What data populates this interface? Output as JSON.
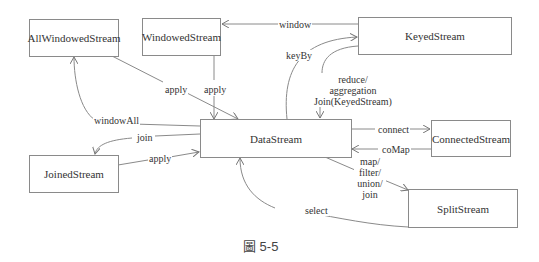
{
  "nodes": {
    "all_windowed_stream": "AllWindowedStream",
    "windowed_stream": "WindowedStream",
    "keyed_stream": "KeyedStream",
    "data_stream": "DataStream",
    "connected_stream": "ConnectedStream",
    "joined_stream": "JoinedStream",
    "split_stream": "SplitStream"
  },
  "edges": {
    "window": "window",
    "key_by": "keyBy",
    "reduce": "reduce/",
    "aggregation": "aggregation",
    "join_keyed": "Join(KeyedStream)",
    "apply_all_windowed": "apply",
    "apply_windowed": "apply",
    "window_all": "windowAll",
    "join": "join",
    "apply_joined": "apply",
    "connect": "connect",
    "co_map": "coMap",
    "map": "map/",
    "filter": "filter/",
    "union": "union/",
    "join_split": "join",
    "select": "select"
  },
  "caption": "圖 5-5",
  "colors": {
    "stroke": "#8a8a8a",
    "text": "#333333"
  }
}
